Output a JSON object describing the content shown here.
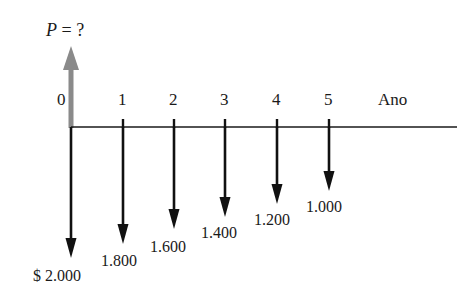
{
  "diagram": {
    "type": "cash-flow-diagram",
    "present_value_label": {
      "variable": "P",
      "text": " = ?"
    },
    "axis_label": "Ano",
    "colors": {
      "outflow_arrow": "#111111",
      "inflow_arrow": "#8a8a8a",
      "timeline": "#1a1a1a"
    },
    "periods": [
      {
        "period": "0",
        "amount_label": "$ 2.000",
        "amount": 2000
      },
      {
        "period": "1",
        "amount_label": "1.800",
        "amount": 1800
      },
      {
        "period": "2",
        "amount_label": "1.600",
        "amount": 1600
      },
      {
        "period": "3",
        "amount_label": "1.400",
        "amount": 1400
      },
      {
        "period": "4",
        "amount_label": "1.200",
        "amount": 1200
      },
      {
        "period": "5",
        "amount_label": "1.000",
        "amount": 1000
      }
    ]
  }
}
